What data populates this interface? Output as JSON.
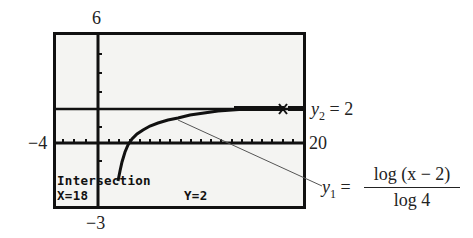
{
  "window": {
    "ymax_label": "6",
    "ymin_label": "−3",
    "xmin_label": "−4",
    "xmax_label": "20"
  },
  "screen": {
    "status_title": "Intersection",
    "x_readout": "X=18",
    "y_readout": "Y=2"
  },
  "annotations": {
    "y2_label_var": "y",
    "y2_label_sub": "2",
    "y2_label_rest": " = 2",
    "y1_label_var": "y",
    "y1_label_sub": "1",
    "y1_label_eq": " =",
    "y1_numerator": "log (x − 2)",
    "y1_denominator": "log 4"
  },
  "graph": {
    "x_range": [
      -4,
      20
    ],
    "y_range": [
      -3,
      6
    ],
    "functions": [
      "y1 = log(x-2)/log 4",
      "y2 = 2"
    ],
    "intersection": {
      "x": 18,
      "y": 2
    },
    "colors": {
      "screen_bg": "#f4f4f2",
      "ink": "#111111",
      "leader": "#555555"
    }
  }
}
